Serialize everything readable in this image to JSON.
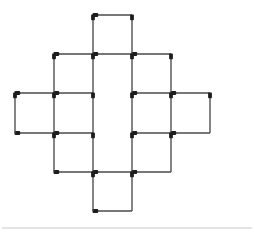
{
  "figure": {
    "kind": "matchstick-puzzle",
    "canvas": {
      "width": 254,
      "height": 235,
      "background": "#ffffff"
    },
    "grid": {
      "columns_x": [
        15,
        54,
        93,
        132,
        171,
        210
      ],
      "rows_y": [
        15,
        54,
        93,
        133,
        172,
        211
      ],
      "cell_size": 39,
      "unit_label": "1 match"
    },
    "style": {
      "stick_color": "#4a4a4a",
      "head_color": "#1d1d1d",
      "stick_width": 1.35,
      "head_radius": 1.9,
      "divider_color": "#c9c9c9"
    },
    "counts": {
      "squares": 12,
      "matches": 40,
      "horizontal_matches": 20,
      "vertical_matches": 20
    },
    "divider": {
      "y": 228,
      "x1": 2,
      "x2": 252
    },
    "squares": [
      {
        "name": "top-centre",
        "col": 2,
        "row": 0
      },
      {
        "name": "upper-left",
        "col": 1,
        "row": 1
      },
      {
        "name": "upper-centre",
        "col": 2,
        "row": 1
      },
      {
        "name": "upper-right",
        "col": 3,
        "row": 1
      },
      {
        "name": "left-outer",
        "col": 0,
        "row": 2
      },
      {
        "name": "left-inner",
        "col": 1,
        "row": 2
      },
      {
        "name": "right-inner",
        "col": 3,
        "row": 2
      },
      {
        "name": "right-outer",
        "col": 4,
        "row": 2
      },
      {
        "name": "lower-left",
        "col": 1,
        "row": 3
      },
      {
        "name": "lower-centre",
        "col": 2,
        "row": 3
      },
      {
        "name": "lower-right",
        "col": 3,
        "row": 3
      },
      {
        "name": "bottom-centre",
        "col": 2,
        "row": 4
      }
    ],
    "matches": [
      {
        "id": "h-r0-c2",
        "orientation": "horizontal",
        "x1": 93,
        "y1": 15,
        "x2": 132,
        "y2": 15,
        "head": "start"
      },
      {
        "id": "h-r1-c1",
        "orientation": "horizontal",
        "x1": 54,
        "y1": 54,
        "x2": 93,
        "y2": 54,
        "head": "start"
      },
      {
        "id": "h-r1-c2",
        "orientation": "horizontal",
        "x1": 93,
        "y1": 54,
        "x2": 132,
        "y2": 54,
        "head": "start"
      },
      {
        "id": "h-r1-c3",
        "orientation": "horizontal",
        "x1": 132,
        "y1": 54,
        "x2": 171,
        "y2": 54,
        "head": "start"
      },
      {
        "id": "h-r2-c0",
        "orientation": "horizontal",
        "x1": 15,
        "y1": 93,
        "x2": 54,
        "y2": 93,
        "head": "start"
      },
      {
        "id": "h-r2-c1",
        "orientation": "horizontal",
        "x1": 54,
        "y1": 93,
        "x2": 93,
        "y2": 93,
        "head": "start"
      },
      {
        "id": "h-r2-c3",
        "orientation": "horizontal",
        "x1": 132,
        "y1": 93,
        "x2": 171,
        "y2": 93,
        "head": "start"
      },
      {
        "id": "h-r2-c4",
        "orientation": "horizontal",
        "x1": 171,
        "y1": 93,
        "x2": 210,
        "y2": 93,
        "head": "start"
      },
      {
        "id": "h-r3-c0",
        "orientation": "horizontal",
        "x1": 15,
        "y1": 133,
        "x2": 54,
        "y2": 133,
        "head": "start"
      },
      {
        "id": "h-r3-c1",
        "orientation": "horizontal",
        "x1": 54,
        "y1": 133,
        "x2": 93,
        "y2": 133,
        "head": "start"
      },
      {
        "id": "h-r3-c3",
        "orientation": "horizontal",
        "x1": 132,
        "y1": 133,
        "x2": 171,
        "y2": 133,
        "head": "start"
      },
      {
        "id": "h-r3-c4",
        "orientation": "horizontal",
        "x1": 171,
        "y1": 133,
        "x2": 210,
        "y2": 133,
        "head": "start"
      },
      {
        "id": "h-r4-c1",
        "orientation": "horizontal",
        "x1": 54,
        "y1": 172,
        "x2": 93,
        "y2": 172,
        "head": "start"
      },
      {
        "id": "h-r4-c2",
        "orientation": "horizontal",
        "x1": 93,
        "y1": 172,
        "x2": 132,
        "y2": 172,
        "head": "start"
      },
      {
        "id": "h-r4-c3",
        "orientation": "horizontal",
        "x1": 132,
        "y1": 172,
        "x2": 171,
        "y2": 172,
        "head": "start"
      },
      {
        "id": "h-r5-c2",
        "orientation": "horizontal",
        "x1": 93,
        "y1": 211,
        "x2": 132,
        "y2": 211,
        "head": "start"
      },
      {
        "id": "v-c2-r0",
        "orientation": "vertical",
        "x1": 93,
        "y1": 15,
        "x2": 93,
        "y2": 54,
        "head": "start"
      },
      {
        "id": "v-c3-r0",
        "orientation": "vertical",
        "x1": 132,
        "y1": 15,
        "x2": 132,
        "y2": 54,
        "head": "start"
      },
      {
        "id": "v-c1-r1",
        "orientation": "vertical",
        "x1": 54,
        "y1": 54,
        "x2": 54,
        "y2": 93,
        "head": "start"
      },
      {
        "id": "v-c2-r1",
        "orientation": "vertical",
        "x1": 93,
        "y1": 54,
        "x2": 93,
        "y2": 93,
        "head": "start"
      },
      {
        "id": "v-c3-r1",
        "orientation": "vertical",
        "x1": 132,
        "y1": 54,
        "x2": 132,
        "y2": 93,
        "head": "start"
      },
      {
        "id": "v-c4-r1",
        "orientation": "vertical",
        "x1": 171,
        "y1": 54,
        "x2": 171,
        "y2": 93,
        "head": "start"
      },
      {
        "id": "v-c0-r2",
        "orientation": "vertical",
        "x1": 15,
        "y1": 93,
        "x2": 15,
        "y2": 133,
        "head": "start"
      },
      {
        "id": "v-c1-r2",
        "orientation": "vertical",
        "x1": 54,
        "y1": 93,
        "x2": 54,
        "y2": 133,
        "head": "start"
      },
      {
        "id": "v-c2-r2",
        "orientation": "vertical",
        "x1": 93,
        "y1": 93,
        "x2": 93,
        "y2": 133,
        "head": "start"
      },
      {
        "id": "v-c3-r2",
        "orientation": "vertical",
        "x1": 132,
        "y1": 93,
        "x2": 132,
        "y2": 133,
        "head": "start"
      },
      {
        "id": "v-c4-r2",
        "orientation": "vertical",
        "x1": 171,
        "y1": 93,
        "x2": 171,
        "y2": 133,
        "head": "start"
      },
      {
        "id": "v-c5-r2",
        "orientation": "vertical",
        "x1": 210,
        "y1": 93,
        "x2": 210,
        "y2": 133,
        "head": "start"
      },
      {
        "id": "v-c1-r3",
        "orientation": "vertical",
        "x1": 54,
        "y1": 133,
        "x2": 54,
        "y2": 172,
        "head": "start"
      },
      {
        "id": "v-c2-r3",
        "orientation": "vertical",
        "x1": 93,
        "y1": 133,
        "x2": 93,
        "y2": 172,
        "head": "start"
      },
      {
        "id": "v-c3-r3",
        "orientation": "vertical",
        "x1": 132,
        "y1": 133,
        "x2": 132,
        "y2": 172,
        "head": "start"
      },
      {
        "id": "v-c4-r3",
        "orientation": "vertical",
        "x1": 171,
        "y1": 133,
        "x2": 171,
        "y2": 172,
        "head": "start"
      },
      {
        "id": "v-c2-r4",
        "orientation": "vertical",
        "x1": 93,
        "y1": 172,
        "x2": 93,
        "y2": 211,
        "head": "start"
      },
      {
        "id": "v-c3-r4",
        "orientation": "vertical",
        "x1": 132,
        "y1": 172,
        "x2": 132,
        "y2": 211,
        "head": "start"
      }
    ]
  }
}
